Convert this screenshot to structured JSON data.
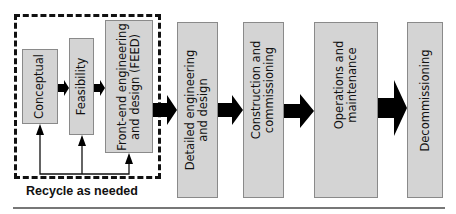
{
  "diagram": {
    "group_label": "Recycle as needed",
    "early_stages": [
      {
        "label": "Conceptual"
      },
      {
        "label": "Feasibility"
      },
      {
        "label_line1": "Front-end engineering",
        "label_line2": "and design (FEED)"
      }
    ],
    "later_stages": [
      {
        "label_line1": "Detailed engineering",
        "label_line2": "and design"
      },
      {
        "label_line1": "Construction and",
        "label_line2": "commissioning"
      },
      {
        "label_line1": "Operations and",
        "label_line2": "maintenance"
      },
      {
        "label": "Decommissioning"
      }
    ],
    "colors": {
      "box_fill": "#d4d4d4",
      "box_border": "#8a8a8a",
      "arrow": "#000000"
    }
  }
}
